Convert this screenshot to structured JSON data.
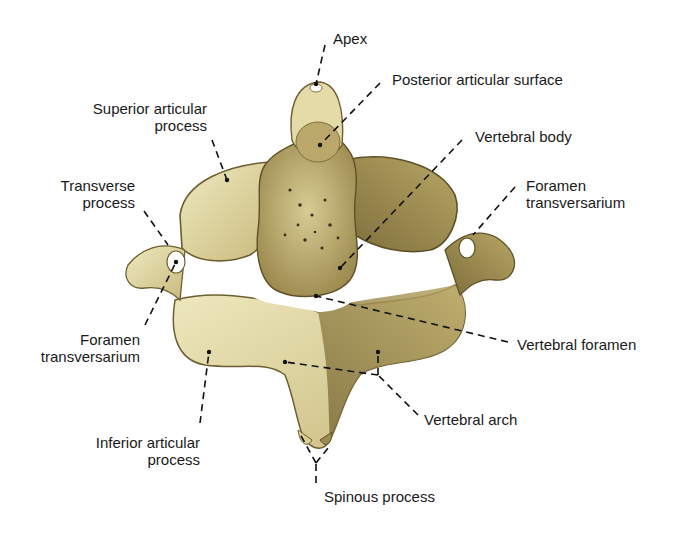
{
  "figure": {
    "colors": {
      "bone_light": "#e9e3b4",
      "bone_mid": "#c9bb7e",
      "bone_dark": "#8a7a45",
      "shadow": "#5e5128",
      "label_text": "#1a1a1a",
      "leader_line": "#111111",
      "background": "#ffffff"
    }
  },
  "labels": {
    "apex": "Apex",
    "posterior_articular_surface": "Posterior articular surface",
    "superior_articular_process": "Superior articular\nprocess",
    "vertebral_body": "Vertebral body",
    "transverse_process": "Transverse\nprocess",
    "foramen_transversarium_right": "Foramen\ntransversarium",
    "foramen_transversarium_left": "Foramen\ntransversarium",
    "vertebral_foramen": "Vertebral foramen",
    "vertebral_arch": "Vertebral arch",
    "inferior_articular_process": "Inferior articular\nprocess",
    "spinous_process": "Spinous process"
  }
}
